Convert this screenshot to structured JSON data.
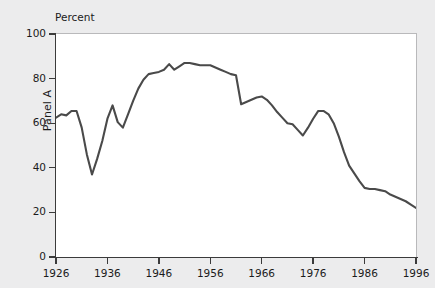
{
  "chart_data": {
    "type": "line",
    "title": "",
    "subtitle": "",
    "units_label": "Percent",
    "ylabel": "Panel A",
    "xlabel": "",
    "ylim": [
      0,
      100
    ],
    "xlim": [
      1926,
      1996
    ],
    "yticks": [
      0,
      20,
      40,
      60,
      80,
      100
    ],
    "ytick_labels": [
      "0",
      "20",
      "40",
      "60",
      "80",
      "100"
    ],
    "xticks": [
      1926,
      1936,
      1946,
      1956,
      1966,
      1976,
      1986,
      1996
    ],
    "xtick_labels": [
      "1926",
      "1936",
      "1946",
      "1956",
      "1966",
      "1976",
      "1986",
      "1996"
    ],
    "grid": false,
    "legend": "none",
    "line_color": "#4a4a4a",
    "line_width": 2.1,
    "series": [
      {
        "name": "Panel A",
        "x": [
          1926,
          1927,
          1928,
          1929,
          1930,
          1931,
          1932,
          1933,
          1934,
          1935,
          1936,
          1937,
          1938,
          1939,
          1940,
          1941,
          1942,
          1943,
          1944,
          1945,
          1946,
          1947,
          1948,
          1949,
          1950,
          1951,
          1952,
          1953,
          1954,
          1955,
          1956,
          1957,
          1958,
          1959,
          1960,
          1961,
          1962,
          1963,
          1964,
          1965,
          1966,
          1967,
          1968,
          1969,
          1970,
          1971,
          1972,
          1973,
          1974,
          1975,
          1976,
          1977,
          1978,
          1979,
          1980,
          1981,
          1982,
          1983,
          1984,
          1985,
          1986,
          1987,
          1988,
          1989,
          1990,
          1991,
          1992,
          1993,
          1994,
          1995,
          1996
        ],
        "values": [
          62.5,
          64.0,
          63.5,
          65.5,
          65.5,
          58.0,
          46.0,
          37.0,
          44.0,
          52.0,
          62.0,
          68.0,
          60.5,
          58.0,
          64.0,
          70.0,
          75.5,
          79.5,
          82.0,
          82.5,
          83.0,
          84.0,
          86.5,
          84.0,
          85.5,
          87.0,
          87.0,
          86.5,
          86.0,
          86.0,
          86.0,
          85.0,
          84.0,
          83.0,
          82.0,
          81.5,
          68.5,
          69.5,
          70.5,
          71.5,
          72.0,
          70.5,
          68.0,
          65.0,
          62.5,
          60.0,
          59.5,
          57.0,
          54.5,
          58.0,
          62.0,
          65.5,
          65.5,
          64.0,
          60.0,
          54.0,
          47.0,
          41.0,
          37.5,
          34.0,
          31.0,
          30.5,
          30.5,
          30.0,
          29.5,
          28.0,
          27.0,
          26.0,
          25.0,
          23.5,
          22.0
        ]
      }
    ]
  }
}
